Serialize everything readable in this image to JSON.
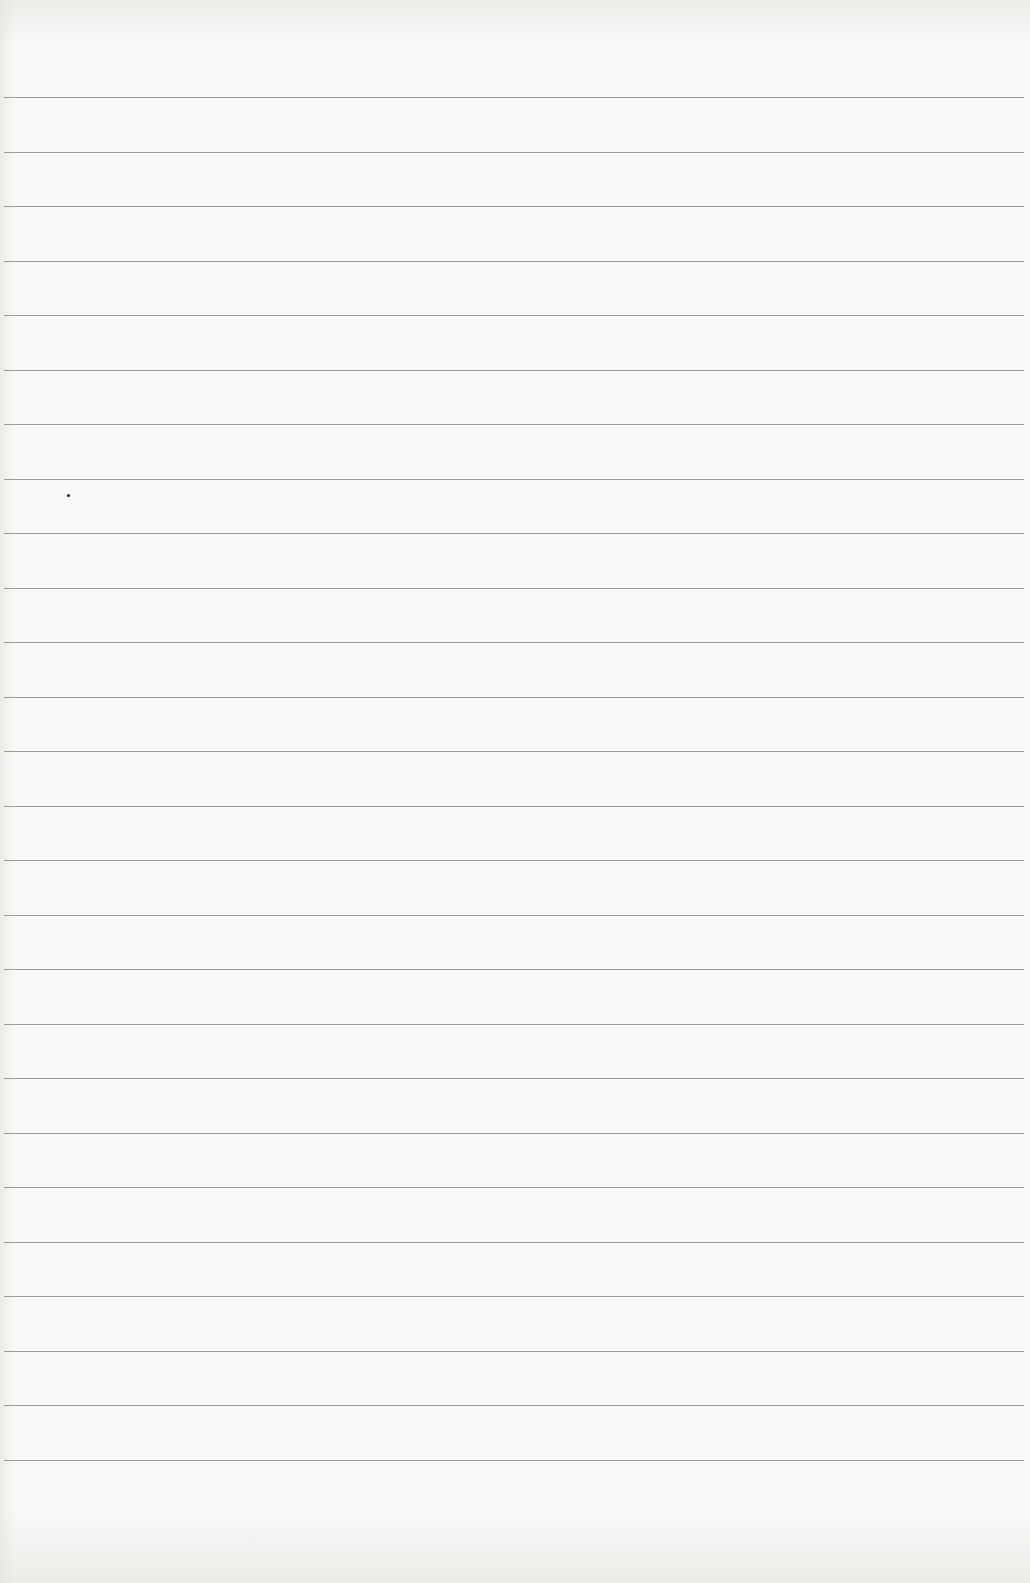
{
  "page": {
    "type": "lined-paper",
    "background_color": "#f8f8f6",
    "line_color": "#8c8c8c",
    "line_count": 26,
    "first_line_y": 97,
    "line_spacing": 54.5
  },
  "lines": [
    {
      "text": ""
    },
    {
      "text": ""
    },
    {
      "text": ""
    },
    {
      "text": ""
    },
    {
      "text": ""
    },
    {
      "text": ""
    },
    {
      "text": ""
    },
    {
      "text": ""
    },
    {
      "text": ""
    },
    {
      "text": ""
    },
    {
      "text": ""
    },
    {
      "text": ""
    },
    {
      "text": ""
    },
    {
      "text": ""
    },
    {
      "text": ""
    },
    {
      "text": ""
    },
    {
      "text": ""
    },
    {
      "text": ""
    },
    {
      "text": ""
    },
    {
      "text": ""
    },
    {
      "text": ""
    },
    {
      "text": ""
    },
    {
      "text": ""
    },
    {
      "text": ""
    },
    {
      "text": ""
    },
    {
      "text": ""
    }
  ],
  "marks": [
    {
      "type": "speck",
      "x": 67,
      "y": 494
    }
  ]
}
